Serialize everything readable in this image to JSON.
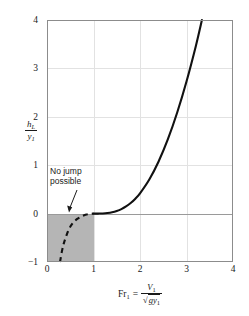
{
  "chart_data": {
    "type": "line",
    "title": "",
    "xlabel": "Fr1 = V1 / sqrt(g*y1)",
    "ylabel": "hL / y1",
    "xlim": [
      0,
      4
    ],
    "ylim": [
      -1,
      4
    ],
    "xticks": [
      0,
      1,
      2,
      3,
      4
    ],
    "yticks": [
      -1,
      0,
      1,
      2,
      3,
      4
    ],
    "grid": true,
    "legend": "none",
    "series": [
      {
        "name": "Head loss ratio (jump possible)",
        "style": "solid",
        "x": [
          1.0,
          1.1,
          1.2,
          1.3,
          1.4,
          1.5,
          1.6,
          1.7,
          1.8,
          1.9,
          2.0,
          2.2,
          2.4,
          2.6,
          2.8,
          3.0,
          3.2,
          3.4,
          3.6,
          3.8,
          4.0
        ],
        "y": [
          0.0,
          0.0005,
          0.003,
          0.011,
          0.027,
          0.054,
          0.093,
          0.147,
          0.218,
          0.308,
          0.419,
          0.705,
          1.077,
          1.538,
          2.089,
          2.73,
          3.46,
          4.281,
          5.191,
          6.191,
          7.281
        ]
      },
      {
        "name": "No jump possible branch",
        "style": "dashed",
        "x": [
          0.28,
          0.32,
          0.36,
          0.4,
          0.45,
          0.5,
          0.55,
          0.6,
          0.65,
          0.7,
          0.75,
          0.8,
          0.85,
          0.9,
          0.95,
          1.0
        ],
        "y": [
          -1.0,
          -0.78,
          -0.62,
          -0.5,
          -0.37,
          -0.27,
          -0.2,
          -0.15,
          -0.11,
          -0.08,
          -0.055,
          -0.035,
          -0.02,
          -0.011,
          -0.004,
          0.0
        ]
      }
    ],
    "shaded_region": {
      "label": "No jump possible",
      "x_range": [
        0,
        1
      ],
      "y_range": [
        -1,
        0
      ],
      "color": "#b5b5b5"
    },
    "annotations": [
      {
        "text": "No jump possible",
        "x": 0.55,
        "y": 0.85,
        "arrow_to": [
          0.62,
          0.02
        ]
      }
    ]
  },
  "axes": {
    "y_label_numerator": "h",
    "y_label_numerator_sub": "L",
    "y_label_denominator": "y",
    "y_label_denominator_sub": "1",
    "x_label_lhs": "Fr",
    "x_label_lhs_sub": "1",
    "x_label_equals": "=",
    "x_label_num": "V",
    "x_label_num_sub": "1",
    "x_label_den_radical": "√",
    "x_label_den": "gy",
    "x_label_den_sub": "1",
    "yticks": [
      "4",
      "3",
      "2",
      "1",
      "0",
      "−1"
    ],
    "xticks": [
      "0",
      "1",
      "2",
      "3",
      "4"
    ]
  },
  "annotation": {
    "line1": "No jump",
    "line2": "possible"
  },
  "colors": {
    "curve": "#111111",
    "frame": "#8c8c8c",
    "grid": "#e2e2e2",
    "zero_line": "#9a9a9a",
    "shade": "#b5b5b5",
    "background": "#ffffff"
  }
}
